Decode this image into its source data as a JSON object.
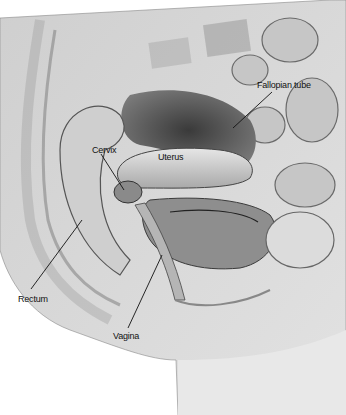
{
  "diagram": {
    "labels": [
      {
        "id": "fallopian",
        "text": "Fallopian tube",
        "x": 257,
        "y": 84
      },
      {
        "id": "cervix",
        "text": "Cervix",
        "x": 94,
        "y": 150
      },
      {
        "id": "uterus",
        "text": "Uterus",
        "x": 158,
        "y": 157
      },
      {
        "id": "rectum",
        "text": "Rectum",
        "x": 16,
        "y": 295
      },
      {
        "id": "vagina",
        "text": "Vagina",
        "x": 115,
        "y": 334
      }
    ],
    "colors": {
      "background": "#ffffff",
      "tissue_light": "#d8d8d8",
      "tissue_mid": "#a8a8a8",
      "tissue_dark": "#505050",
      "outline": "#444444"
    }
  }
}
